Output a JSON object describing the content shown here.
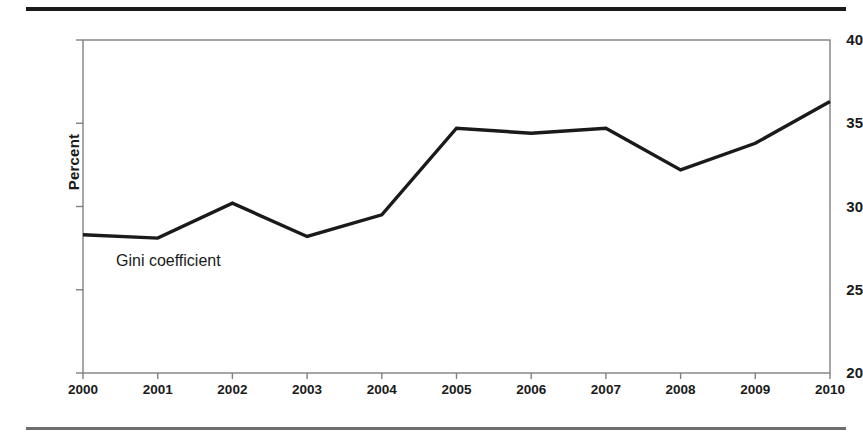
{
  "figure": {
    "y_axis_title": "Percent",
    "series_annotation": "Gini coefficient"
  },
  "chart_data": {
    "type": "line",
    "title": "",
    "xlabel": "",
    "ylabel": "Percent",
    "categories": [
      "2000",
      "2001",
      "2002",
      "2003",
      "2004",
      "2005",
      "2006",
      "2007",
      "2008",
      "2009",
      "2010"
    ],
    "x": [
      2000,
      2001,
      2002,
      2003,
      2004,
      2005,
      2006,
      2007,
      2008,
      2009,
      2010
    ],
    "series": [
      {
        "name": "Gini coefficient",
        "values": [
          28.3,
          28.1,
          30.2,
          28.2,
          29.5,
          34.7,
          34.4,
          34.7,
          32.2,
          33.8,
          36.3
        ],
        "color": "#1a1a1a",
        "line_width": 3.4
      }
    ],
    "ylim": [
      20,
      40
    ],
    "yticks": [
      20,
      25,
      30,
      35,
      40
    ],
    "ytick_labels": [
      "20",
      "25",
      "30",
      "35",
      "40"
    ],
    "xlim": [
      2000,
      2010
    ],
    "xticks": [
      2000,
      2001,
      2002,
      2003,
      2004,
      2005,
      2006,
      2007,
      2008,
      2009,
      2010
    ],
    "grid": false,
    "legend": "inline-annotation",
    "legend_position": "inside-lower-left",
    "frame_color": "#808080",
    "text_color": "#1a1a1a",
    "annotations": [
      {
        "text": "Gini coefficient",
        "x": 2000.5,
        "y": 26.9
      }
    ]
  },
  "decorations": {
    "rule_top_color": "#1a1a1a",
    "rule_bottom_color": "#6e6e6e"
  }
}
